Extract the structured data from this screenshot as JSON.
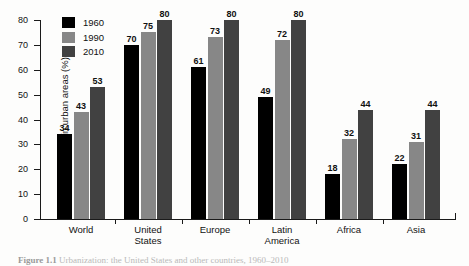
{
  "figure": {
    "caption_label": "Figure 1.1",
    "caption_text": "Urbanization: the United States and other countries, 1960–2010"
  },
  "chart_data": {
    "type": "bar",
    "title": "",
    "xlabel": "",
    "ylabel": "Population in urban areas (%)",
    "ylim": [
      0,
      80
    ],
    "yticks": [
      0,
      10,
      20,
      30,
      40,
      50,
      60,
      70,
      80
    ],
    "grid": false,
    "legend_position": "top-left",
    "categories": [
      "World",
      "United\nStates",
      "Europe",
      "Latin\nAmerica",
      "Africa",
      "Asia"
    ],
    "series": [
      {
        "name": "1960",
        "color": "#000000",
        "values": [
          34,
          70,
          61,
          49,
          18,
          22
        ]
      },
      {
        "name": "1990",
        "color": "#878787",
        "values": [
          43,
          75,
          73,
          72,
          32,
          31
        ]
      },
      {
        "name": "2010",
        "color": "#414141",
        "values": [
          53,
          80,
          80,
          80,
          44,
          44
        ]
      }
    ]
  }
}
